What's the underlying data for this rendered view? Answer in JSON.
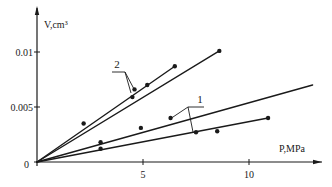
{
  "chart_data": {
    "type": "line",
    "title": "",
    "xlabel": "P,MPa",
    "ylabel": "V,cm³",
    "xlim": [
      0,
      13
    ],
    "ylim": [
      0,
      0.0125
    ],
    "x_ticks": [
      {
        "value": 5,
        "label": "5"
      },
      {
        "value": 10,
        "label": "10"
      }
    ],
    "y_ticks": [
      {
        "value": 0,
        "label": "0"
      },
      {
        "value": 0.005,
        "label": "0.005"
      },
      {
        "value": 0.01,
        "label": "0.01"
      }
    ],
    "grid": false,
    "legend": "callout labels '1' and '2' pointing at line pairs",
    "series": [
      {
        "name": "2a",
        "group": "2",
        "points": [
          [
            0,
            0
          ],
          [
            2.2,
            0.0035
          ],
          [
            4.6,
            0.0066
          ],
          [
            5.2,
            0.0072
          ],
          [
            8.6,
            0.0101
          ]
        ]
      },
      {
        "name": "2b",
        "group": "2",
        "points": [
          [
            0,
            0
          ],
          [
            4.5,
            0.0059
          ],
          [
            5.2,
            0.007
          ],
          [
            6.5,
            0.0087
          ]
        ]
      },
      {
        "name": "1a",
        "group": "1",
        "points": [
          [
            0,
            0
          ],
          [
            3.0,
            0.0018
          ],
          [
            4.9,
            0.0031
          ],
          [
            6.3,
            0.004
          ],
          [
            13.0,
            0.007
          ]
        ]
      },
      {
        "name": "1b",
        "group": "1",
        "points": [
          [
            0,
            0
          ],
          [
            3.0,
            0.0012
          ],
          [
            7.5,
            0.0027
          ],
          [
            8.5,
            0.0028
          ],
          [
            10.9,
            0.004
          ]
        ]
      }
    ],
    "markers": {
      "2a": [
        [
          2.2,
          0.0035
        ],
        [
          4.6,
          0.0066
        ],
        [
          8.6,
          0.0101
        ]
      ],
      "2b": [
        [
          4.5,
          0.0059
        ],
        [
          5.2,
          0.007
        ],
        [
          6.5,
          0.0087
        ]
      ],
      "1a": [
        [
          3.0,
          0.0018
        ],
        [
          4.9,
          0.0031
        ],
        [
          6.3,
          0.004
        ]
      ],
      "1b": [
        [
          3.0,
          0.0012
        ],
        [
          7.5,
          0.0027
        ],
        [
          8.5,
          0.0028
        ],
        [
          10.9,
          0.004
        ]
      ]
    },
    "annotations": [
      {
        "text": "1",
        "target_group": "1"
      },
      {
        "text": "2",
        "target_group": "2"
      }
    ]
  },
  "axes": {
    "x_label": "P,MPa",
    "y_label": "V,cm³",
    "origin_label": "0"
  },
  "colors": {
    "ink": "#1a1a1a",
    "background": "#ffffff"
  }
}
